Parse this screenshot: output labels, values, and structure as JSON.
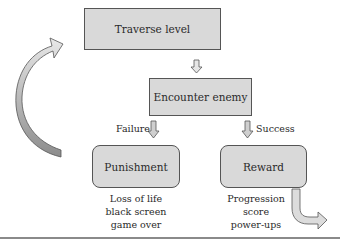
{
  "diagram": {
    "nodes": {
      "traverse": "Traverse level",
      "encounter": "Encounter enemy",
      "punishment": "Punishment",
      "reward": "Reward"
    },
    "edges": {
      "failure": "Failure",
      "success": "Success"
    },
    "punishment_outcomes": [
      "Loss of life",
      "black screen",
      "game over"
    ],
    "reward_outcomes": [
      "Progression",
      "score",
      "power-ups"
    ]
  },
  "colors": {
    "box_fill": "#d9d9d9",
    "border": "#555555",
    "loop_arrow_dark": "#8c8c8c",
    "loop_arrow_light": "#e6e6e6"
  }
}
